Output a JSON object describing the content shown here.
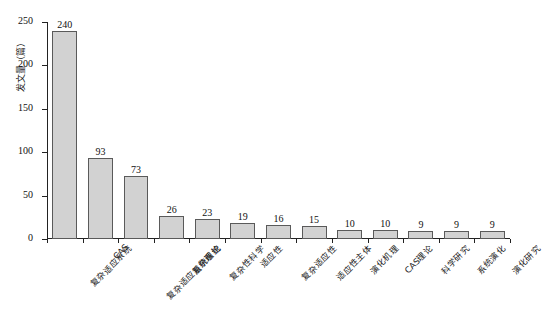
{
  "chart_data": {
    "type": "bar",
    "title": "",
    "xlabel": "",
    "ylabel": "发文量（篇）",
    "ylim": [
      0,
      250
    ],
    "ytick_labels": [
      "0",
      "50",
      "100",
      "150",
      "200",
      "250"
    ],
    "ytick_values": [
      0,
      50,
      100,
      150,
      200,
      250
    ],
    "grid": false,
    "legend": null,
    "bar_color": "#d2d2d2",
    "bar_edge_color": "#5a5a5a",
    "categories": [
      "复杂适应系统",
      "CAS",
      "复杂适应系统理论",
      "复杂系统",
      "复杂性科学",
      "适应性",
      "复杂适应性",
      "适应性主体",
      "演化机理",
      "CAS理论",
      "科学研究",
      "系统演化",
      "演化研究"
    ],
    "values": [
      240,
      93,
      73,
      26,
      23,
      19,
      16,
      15,
      10,
      10,
      9,
      9,
      9
    ],
    "value_labels": [
      "240",
      "93",
      "73",
      "26",
      "23",
      "19",
      "16",
      "15",
      "10",
      "10",
      "9",
      "9",
      "9"
    ]
  }
}
